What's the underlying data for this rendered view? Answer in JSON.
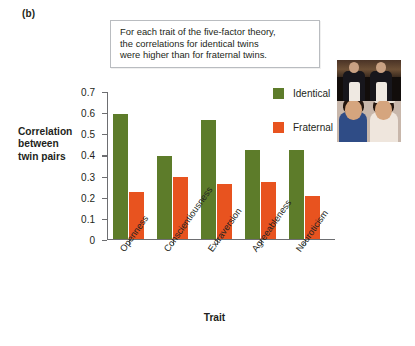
{
  "panel_label": "(b)",
  "callout": {
    "lines": [
      "For each trait of the five-factor theory,",
      "the correlations for identical twins",
      "were higher than for fraternal twins."
    ]
  },
  "photos": [
    {
      "caption": "identical-twin-men-photo"
    },
    {
      "caption": "fraternal-twin-women-photo"
    }
  ],
  "legend": {
    "position": "upper-right-inside",
    "items": [
      {
        "label": "Identical",
        "color": "#5d7c2a"
      },
      {
        "label": "Fraternal",
        "color": "#e8531f"
      }
    ]
  },
  "axes": {
    "y_title_lines": [
      "Correlation",
      "between",
      "twin pairs"
    ],
    "x_title": "Trait",
    "y_ticks": [
      "0.7",
      "0.6",
      "0.5",
      "0.4",
      "0.3",
      "0.2",
      "0.1",
      "0"
    ]
  },
  "chart_data": {
    "type": "bar",
    "title": "",
    "xlabel": "Trait",
    "ylabel": "Correlation between twin pairs",
    "ylim": [
      0,
      0.7
    ],
    "ytick_values": [
      0.7,
      0.6,
      0.5,
      0.4,
      0.3,
      0.2,
      0.1,
      0
    ],
    "grid": false,
    "legend_position": "upper-right-inside",
    "categories": [
      "Openness",
      "Conscientiousness",
      "Extraversion",
      "Agreeableness",
      "Neuroticism"
    ],
    "series": [
      {
        "name": "Identical",
        "color": "#5d7c2a",
        "values": [
          0.59,
          0.39,
          0.56,
          0.42,
          0.42
        ]
      },
      {
        "name": "Fraternal",
        "color": "#e8531f",
        "values": [
          0.22,
          0.29,
          0.26,
          0.27,
          0.2
        ]
      }
    ],
    "annotations": [
      "For each trait of the five-factor theory, the correlations for identical twins were higher than for fraternal twins."
    ]
  }
}
